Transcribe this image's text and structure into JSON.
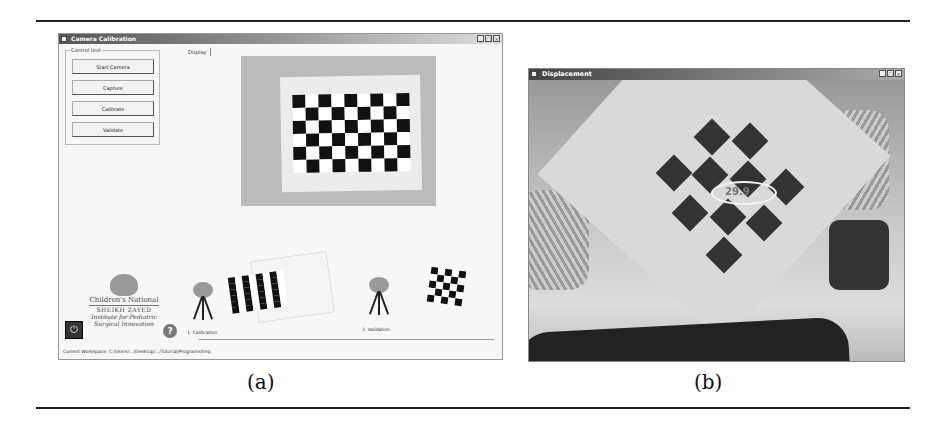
{
  "figure": {
    "captions": {
      "a": "(a)",
      "b": "(b)"
    }
  },
  "window_a": {
    "title": "Camera Calibration",
    "controls": {
      "minimize": "_",
      "maximize": "□",
      "close": "×"
    },
    "control_group": {
      "label": "Control Unit",
      "buttons": [
        {
          "label": "Start Camera"
        },
        {
          "label": "Capture"
        },
        {
          "label": "Calibrate"
        },
        {
          "label": "Validate"
        }
      ]
    },
    "tab": {
      "label": "Display"
    },
    "steps": [
      {
        "label": "1. Calibration"
      },
      {
        "label": "2. Validation"
      }
    ],
    "logo": {
      "line1": "Children's National",
      "line2": "SHEIKH ZAYED",
      "line3": "Institute for Pediatric",
      "line4": "Surgical Innovation"
    },
    "power_icon": "⏻",
    "help_icon": "?",
    "status": "Current Workspace: C:/Users/.../Desktop/.../Tutorial/Programs/tmp"
  },
  "window_b": {
    "title": "Displacement",
    "controls": {
      "minimize": "_",
      "maximize": "□",
      "close": "×"
    },
    "overlay_reading": "29.9"
  }
}
